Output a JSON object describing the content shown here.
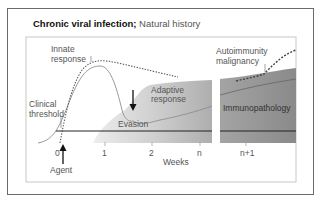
{
  "title": {
    "bold": "Chronic viral infection;",
    "normal": "Natural history"
  },
  "labels": {
    "innate_response_1": "Innate",
    "innate_response_2": "response",
    "autoimmunity_1": "Autoimmunity",
    "autoimmunity_2": "malignancy",
    "adaptive_1": "Adaptive",
    "adaptive_2": "response",
    "clinical_1": "Clinical",
    "clinical_2": "threshold",
    "evasion": "Evasion",
    "immunopathology": "Immunopathology",
    "agent": "Agent",
    "weeks": "Weeks"
  },
  "x_ticks": [
    "0",
    "1",
    "2",
    "n",
    "n+1"
  ],
  "colors": {
    "frame": "#6a6a6a",
    "inner_frame": "#c8c8c8",
    "shade_light": "#e2e2e2",
    "shade_mid": "#b5b5b5",
    "shade_dark": "#8f8f8f",
    "threshold_line": "#222222"
  }
}
